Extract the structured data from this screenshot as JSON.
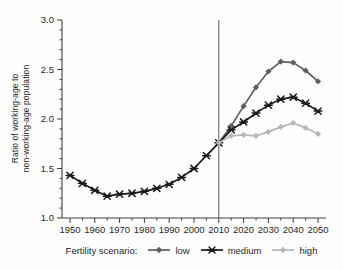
{
  "chart_data": {
    "type": "line",
    "title": "",
    "ylabel_lines": [
      "Ratio of working-age to",
      "non-working-age population"
    ],
    "xlabel": "",
    "xlim": [
      1950,
      2050
    ],
    "ylim": [
      1.0,
      3.0
    ],
    "x_ticks": [
      1950,
      1960,
      1970,
      1980,
      1990,
      2000,
      2010,
      2020,
      2030,
      2040,
      2050
    ],
    "x_minor_step": 5,
    "y_ticks": [
      1.0,
      1.5,
      2.0,
      2.5,
      3.0
    ],
    "y_minor_step": 0.1,
    "grid": false,
    "vertical_reference_line": {
      "x": 2010,
      "color": "#4a4a4a"
    },
    "axis_color": "#3d3d3d",
    "tick_label_color": "#262626",
    "series": [
      {
        "name": "low",
        "color": "#5f5f5f",
        "marker": "diamond",
        "x": [
          2010,
          2015,
          2020,
          2025,
          2030,
          2035,
          2040,
          2045,
          2050
        ],
        "values": [
          1.76,
          1.93,
          2.13,
          2.32,
          2.48,
          2.58,
          2.57,
          2.49,
          2.38
        ]
      },
      {
        "name": "medium",
        "color": "#1a1a1a",
        "marker": "star",
        "x": [
          1950,
          1955,
          1960,
          1965,
          1970,
          1975,
          1980,
          1985,
          1990,
          1995,
          2000,
          2005,
          2010,
          2015,
          2020,
          2025,
          2030,
          2035,
          2040,
          2045,
          2050
        ],
        "values": [
          1.43,
          1.35,
          1.28,
          1.22,
          1.24,
          1.25,
          1.27,
          1.3,
          1.34,
          1.41,
          1.5,
          1.63,
          1.76,
          1.89,
          1.97,
          2.06,
          2.14,
          2.2,
          2.22,
          2.16,
          2.08
        ]
      },
      {
        "name": "high",
        "color": "#b8b8b8",
        "marker": "diamond",
        "x": [
          2010,
          2015,
          2020,
          2025,
          2030,
          2035,
          2040,
          2045,
          2050
        ],
        "values": [
          1.76,
          1.83,
          1.84,
          1.83,
          1.87,
          1.92,
          1.96,
          1.91,
          1.85
        ]
      }
    ],
    "legend": {
      "title": "Fertility scenario:",
      "position": "bottom",
      "entries": [
        {
          "label": "low",
          "color": "#5f5f5f",
          "marker": "diamond"
        },
        {
          "label": "medium",
          "color": "#1a1a1a",
          "marker": "star"
        },
        {
          "label": "high",
          "color": "#b8b8b8",
          "marker": "diamond"
        }
      ]
    }
  }
}
